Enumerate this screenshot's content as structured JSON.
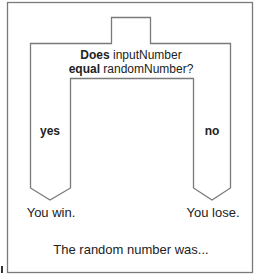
{
  "diagram": {
    "type": "if-else decision block",
    "colors": {
      "line": "#7a7a7a",
      "text": "#222222",
      "background": "#ffffff"
    },
    "condition": {
      "line1_bold": "Does",
      "line1_rest": " inputNumber",
      "line2_bold": "equal",
      "line2_rest": " randomNumber?"
    },
    "branches": [
      {
        "label": "yes",
        "result": "You win."
      },
      {
        "label": "no",
        "result": "You lose."
      }
    ],
    "footer": "The random number was..."
  }
}
